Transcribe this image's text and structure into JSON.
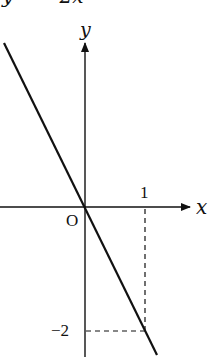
{
  "caption": "y = −2x",
  "axes": {
    "x_label": "x",
    "y_label": "y",
    "origin_label": "O"
  },
  "ticks": {
    "x_tick_label": "1",
    "y_tick_label": "−2"
  },
  "graph": {
    "equation": "y = -2x",
    "slope": -2,
    "marked_point": {
      "x": 1,
      "y": -2
    }
  },
  "colors": {
    "ink": "#111111",
    "background": "#ffffff"
  }
}
